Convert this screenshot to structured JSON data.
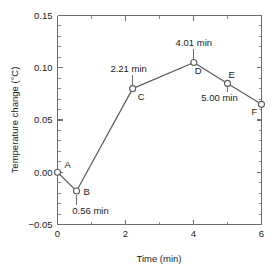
{
  "chart_data": {
    "type": "line",
    "title": "",
    "xlabel": "Time (min)",
    "ylabel": "Temperature change (°C)",
    "xlim": [
      0,
      6
    ],
    "ylim": [
      -0.05,
      0.15
    ],
    "grid": false,
    "legend": "none",
    "x_ticks_major": [
      "0",
      "2",
      "4",
      "6"
    ],
    "x_ticks_major_values": [
      0,
      2,
      4,
      6
    ],
    "x_ticks_minor_values": [
      1,
      3,
      5
    ],
    "y_ticks_major": [
      "0.15",
      "0.10",
      "0.05",
      "0.00",
      "−0.05"
    ],
    "y_ticks_major_values": [
      0.15,
      0.1,
      0.05,
      0.0,
      -0.05
    ],
    "y_ticks_minor_step": 0.01,
    "marker_style": "open-circle",
    "line_color": "#5a5a5a",
    "axis_color": "#6e6e6e",
    "x": [
      0.0,
      0.56,
      2.21,
      4.01,
      5.0,
      6.0
    ],
    "values": [
      0.0,
      -0.018,
      0.08,
      0.105,
      0.085,
      0.065
    ],
    "points": [
      {
        "label": "A",
        "x": 0.0,
        "y": 0.0,
        "label_dx": 7,
        "label_dy": -4,
        "callout": null
      },
      {
        "label": "B",
        "x": 0.56,
        "y": -0.018,
        "label_dx": 7,
        "label_dy": 4,
        "callout": {
          "text": "0.56 min",
          "side": "below",
          "leader": 14,
          "dx": 14
        }
      },
      {
        "label": "C",
        "x": 2.21,
        "y": 0.08,
        "label_dx": 5,
        "label_dy": 11,
        "callout": {
          "text": "2.21 min",
          "side": "above",
          "leader": 14,
          "dx": -4
        }
      },
      {
        "label": "D",
        "x": 4.01,
        "y": 0.105,
        "label_dx": 1,
        "label_dy": 11,
        "callout": {
          "text": "4.01 min",
          "side": "above",
          "leader": 14,
          "dx": 0
        }
      },
      {
        "label": "E",
        "x": 5.0,
        "y": 0.085,
        "label_dx": 1,
        "label_dy": -5,
        "callout": {
          "text": "5.00 min",
          "side": "below",
          "leader": 9,
          "dx": -8
        }
      },
      {
        "label": "F",
        "x": 6.0,
        "y": 0.065,
        "label_dx": -10,
        "label_dy": 11,
        "callout": null
      }
    ]
  },
  "figure": {
    "xlabel": "Time (min)",
    "ylabel": "Temperature change (°C)"
  }
}
